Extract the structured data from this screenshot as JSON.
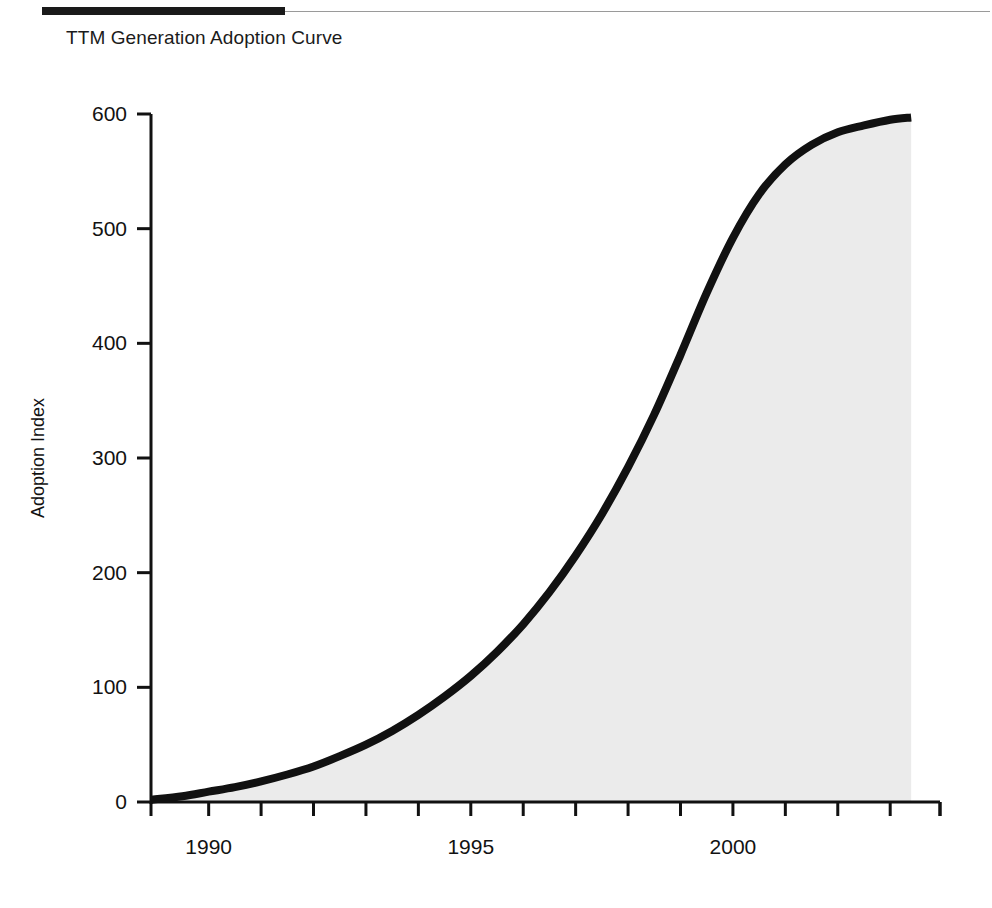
{
  "header": {
    "rule_thick_color": "#1a1a1a",
    "rule_thin_color": "#9a9a9a"
  },
  "title": "TTM Generation Adoption Curve",
  "chart_data": {
    "type": "area",
    "title": "TTM Generation Adoption Curve",
    "xlabel": "",
    "ylabel": "Adoption Index",
    "xlim": [
      1988.9,
      2003.95
    ],
    "ylim": [
      0,
      620
    ],
    "grid": false,
    "legend": null,
    "line_color": "#111111",
    "fill_color": "#ebebeb",
    "x_tick_labels": [
      "1990",
      "1995",
      "2000"
    ],
    "x_tick_values": [
      1990,
      1995,
      2000
    ],
    "x_minor_tick_values": [
      1988.9,
      1990,
      1991,
      1992,
      1993,
      1994,
      1995,
      1996,
      1997,
      1998,
      1999,
      2000,
      2001,
      2002,
      2003,
      2003.95
    ],
    "y_tick_labels": [
      "0",
      "100",
      "200",
      "300",
      "400",
      "500",
      "600"
    ],
    "y_tick_values": [
      0,
      100,
      200,
      300,
      400,
      500,
      600
    ],
    "series": [
      {
        "name": "Adoption Index",
        "x": [
          1988.9,
          1989.5,
          1990.0,
          1990.5,
          1991.0,
          1991.5,
          1992.0,
          1992.5,
          1993.0,
          1993.5,
          1994.0,
          1994.5,
          1995.0,
          1995.5,
          1996.0,
          1996.5,
          1997.0,
          1997.5,
          1998.0,
          1998.5,
          1999.0,
          1999.5,
          2000.0,
          2000.5,
          2001.0,
          2001.5,
          2002.0,
          2002.5,
          2003.0,
          2003.4
        ],
        "values": [
          2,
          5,
          9,
          13,
          18,
          24,
          31,
          40,
          50,
          62,
          76,
          92,
          110,
          131,
          155,
          183,
          215,
          251,
          292,
          338,
          390,
          444,
          492,
          530,
          556,
          573,
          584,
          590,
          595,
          597
        ]
      }
    ]
  }
}
